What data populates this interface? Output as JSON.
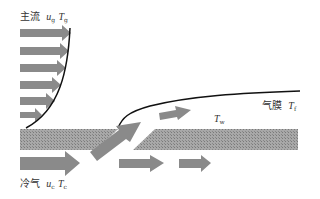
{
  "labels": {
    "mainstream": {
      "text": "主流",
      "symbol_u": "u",
      "sub_u": "g",
      "symbol_T": "T",
      "sub_T": "g"
    },
    "coolant": {
      "text": "冷气",
      "symbol_u": "u",
      "sub_u": "c",
      "symbol_T": "T",
      "sub_T": "c"
    },
    "film": {
      "text": "气膜",
      "symbol_T": "T",
      "sub_T": "f"
    },
    "wall": {
      "symbol_T": "T",
      "sub_T": "w"
    }
  },
  "colors": {
    "arrow": "#8a8a8a",
    "plate": "#9e9e9e",
    "line": "#111111",
    "text": "#333333"
  }
}
